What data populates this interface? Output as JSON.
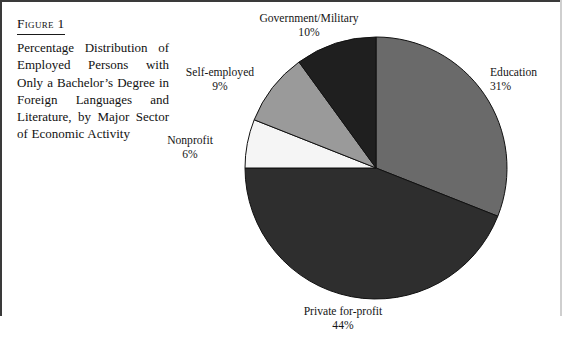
{
  "figure": {
    "label": "Figure 1",
    "caption": "Percentage Distribution of Employed Persons with Only a Bachelor’s Degree in Foreign Languages and Literature, by Major Sector of Economic Activity"
  },
  "chart_data": {
    "type": "pie",
    "title": "Percentage Distribution of Employed Persons with Only a Bachelor’s Degree in Foreign Languages and Literature, by Major Sector of Economic Activity",
    "xlabel": "",
    "ylabel": "",
    "units": "percent",
    "start_angle_deg": 0,
    "direction": "clockwise",
    "legend": "none (slices labeled directly)",
    "grid": false,
    "categories": [
      "Education",
      "Private for-profit",
      "Nonprofit",
      "Self-employed",
      "Government/Military"
    ],
    "values": [
      31,
      44,
      6,
      9,
      10
    ],
    "colors": [
      "#6a6a6a",
      "#2e2e2e",
      "#f5f5f5",
      "#9a9a9a",
      "#1f1f1f"
    ],
    "slices": [
      {
        "name": "Education",
        "value": 31,
        "value_text": "31%",
        "color": "#6a6a6a",
        "start_deg": 0,
        "end_deg": 111.6
      },
      {
        "name": "Private for-profit",
        "value": 44,
        "value_text": "44%",
        "color": "#2e2e2e",
        "start_deg": 111.6,
        "end_deg": 270
      },
      {
        "name": "Nonprofit",
        "value": 6,
        "value_text": "6%",
        "color": "#f5f5f5",
        "start_deg": 270,
        "end_deg": 291.6
      },
      {
        "name": "Self-employed",
        "value": 9,
        "value_text": "9%",
        "color": "#9a9a9a",
        "start_deg": 291.6,
        "end_deg": 324
      },
      {
        "name": "Government/Military",
        "value": 10,
        "value_text": "10%",
        "color": "#1f1f1f",
        "start_deg": 324,
        "end_deg": 360
      }
    ]
  },
  "labels": {
    "government": {
      "name": "Government/Military",
      "pct": "10%"
    },
    "self_employed": {
      "name": "Self-employed",
      "pct": "9%"
    },
    "nonprofit": {
      "name": "Nonprofit",
      "pct": "6%"
    },
    "education": {
      "name": "Education",
      "pct": "31%"
    },
    "private": {
      "name": "Private for-profit",
      "pct": "44%"
    }
  }
}
